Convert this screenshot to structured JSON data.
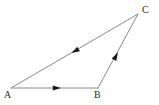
{
  "figure": {
    "kind": "triangle-vector-diagram",
    "background_color": "#ffffff",
    "line_color": "#8a8a8a",
    "arrow_color": "#1a1a1a",
    "label_color": "#2b2b2b",
    "line_width": 1,
    "vertices": [
      {
        "name": "A",
        "label": "A",
        "x": 11,
        "y": 88,
        "label_x": 4,
        "label_y": 90
      },
      {
        "name": "B",
        "label": "B",
        "x": 98,
        "y": 88,
        "label_x": 94,
        "label_y": 90
      },
      {
        "name": "C",
        "label": "C",
        "x": 138,
        "y": 14,
        "label_x": 142,
        "label_y": 5
      }
    ],
    "edges": [
      {
        "name": "edge-AB",
        "from": "A",
        "to": "B",
        "x1": 11,
        "y1": 88,
        "x2": 98,
        "y2": 88,
        "arrow": {
          "x": 57,
          "y": 88,
          "angle_deg": 0,
          "direction": "A-to-B"
        }
      },
      {
        "name": "edge-BC",
        "from": "B",
        "to": "C",
        "x1": 98,
        "y1": 88,
        "x2": 138,
        "y2": 14,
        "arrow": {
          "x": 116,
          "y": 56,
          "angle_deg": -61.6,
          "direction": "B-to-C"
        }
      },
      {
        "name": "edge-CA",
        "from": "C",
        "to": "A",
        "x1": 138,
        "y1": 14,
        "x2": 11,
        "y2": 88,
        "arrow": {
          "x": 75,
          "y": 51,
          "angle_deg": 149.8,
          "direction": "C-to-A"
        }
      }
    ]
  }
}
